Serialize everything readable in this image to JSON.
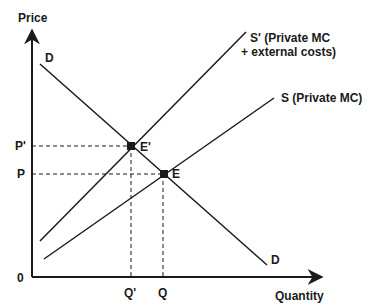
{
  "diagram": {
    "axes": {
      "y_label": "Price",
      "x_label": "Quantity",
      "origin_label": "0"
    },
    "curves": {
      "demand": {
        "label_top": "D",
        "label_bottom": "D"
      },
      "supply_social": {
        "label_line1": "S' (Private MC",
        "label_line2": "+ external costs)"
      },
      "supply_private": {
        "label": "S (Private MC)"
      }
    },
    "points": {
      "e_prime": {
        "label": "E'"
      },
      "e": {
        "label": "E"
      }
    },
    "ticks": {
      "p_prime": "P'",
      "p": "P",
      "q_prime": "Q'",
      "q": "Q"
    },
    "colors": {
      "ink": "#1a1a1a",
      "background": "#ffffff"
    }
  }
}
